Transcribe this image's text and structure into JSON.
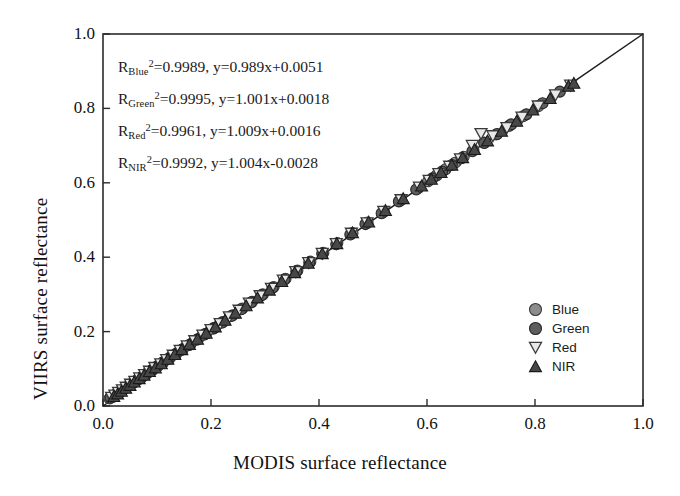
{
  "chart_data": {
    "type": "scatter",
    "title": "",
    "xlabel": "MODIS surface reflectance",
    "ylabel": "VIIRS surface reflectance",
    "xlim": [
      0.0,
      1.0
    ],
    "ylim": [
      0.0,
      1.0
    ],
    "xticks": [
      "0.0",
      "0.2",
      "0.4",
      "0.6",
      "0.8",
      "1.0"
    ],
    "yticks": [
      "0.0",
      "0.2",
      "0.4",
      "0.6",
      "0.8",
      "1.0"
    ],
    "xtick_values": [
      0.0,
      0.2,
      0.4,
      0.6,
      0.8,
      1.0
    ],
    "ytick_values": [
      0.0,
      0.2,
      0.4,
      0.6,
      0.8,
      1.0
    ],
    "grid": false,
    "legend_position": "lower-right",
    "reference_line": {
      "name": "one-to-one-line",
      "from": [
        0.0,
        0.0
      ],
      "to": [
        1.0,
        1.0
      ],
      "color": "#1a1a1a"
    },
    "annotations": [
      {
        "band": "Blue",
        "r2": "0.9989",
        "equation": "y=0.989x+0.0051",
        "text": "R_Blue^2 =0.9989, y=0.989x+0.0051"
      },
      {
        "band": "Green",
        "r2": "0.9995",
        "equation": "y=1.001x+0.0018",
        "text": "R_Green^2 =0.9995, y=1.001x+0.0018"
      },
      {
        "band": "Red",
        "r2": "0.9961",
        "equation": "y=1.009x+0.0016",
        "text": "R_Red^2 =0.9961, y=1.009x+0.0016"
      },
      {
        "band": "NIR",
        "r2": "0.9992",
        "equation": "y=1.004x-0.0028",
        "text": "R_NIR^2 =0.9992, y=1.004x-0.0028"
      }
    ],
    "series": [
      {
        "name": "Blue",
        "label": "Blue",
        "marker": "circle",
        "fill": "#8c8c8c",
        "stroke": "#3a3a3a",
        "marker_size": 11,
        "points": [
          [
            0.012,
            0.02
          ],
          [
            0.018,
            0.024
          ],
          [
            0.024,
            0.031
          ],
          [
            0.03,
            0.036
          ],
          [
            0.036,
            0.042
          ],
          [
            0.042,
            0.049
          ],
          [
            0.05,
            0.057
          ],
          [
            0.058,
            0.064
          ],
          [
            0.066,
            0.072
          ],
          [
            0.074,
            0.08
          ],
          [
            0.082,
            0.088
          ],
          [
            0.092,
            0.097
          ],
          [
            0.102,
            0.108
          ],
          [
            0.112,
            0.118
          ],
          [
            0.124,
            0.13
          ],
          [
            0.136,
            0.141
          ],
          [
            0.148,
            0.153
          ],
          [
            0.162,
            0.166
          ],
          [
            0.176,
            0.18
          ],
          [
            0.19,
            0.194
          ],
          [
            0.206,
            0.21
          ],
          [
            0.222,
            0.226
          ],
          [
            0.24,
            0.244
          ],
          [
            0.258,
            0.262
          ],
          [
            0.276,
            0.28
          ],
          [
            0.296,
            0.3
          ],
          [
            0.316,
            0.32
          ],
          [
            0.338,
            0.342
          ],
          [
            0.36,
            0.364
          ],
          [
            0.384,
            0.388
          ],
          [
            0.408,
            0.412
          ],
          [
            0.434,
            0.438
          ],
          [
            0.462,
            0.465
          ],
          [
            0.49,
            0.493
          ],
          [
            0.52,
            0.522
          ],
          [
            0.552,
            0.554
          ],
          [
            0.584,
            0.586
          ],
          [
            0.602,
            0.604
          ],
          [
            0.618,
            0.62
          ],
          [
            0.634,
            0.636
          ],
          [
            0.652,
            0.654
          ],
          [
            0.668,
            0.67
          ],
          [
            0.686,
            0.688
          ],
          [
            0.706,
            0.708
          ],
          [
            0.728,
            0.73
          ],
          [
            0.752,
            0.753
          ],
          [
            0.778,
            0.779
          ],
          [
            0.806,
            0.806
          ]
        ]
      },
      {
        "name": "Green",
        "label": "Green",
        "marker": "circle",
        "fill": "#5e5e5e",
        "stroke": "#262626",
        "marker_size": 11,
        "points": [
          [
            0.014,
            0.022
          ],
          [
            0.02,
            0.028
          ],
          [
            0.026,
            0.034
          ],
          [
            0.033,
            0.04
          ],
          [
            0.04,
            0.047
          ],
          [
            0.047,
            0.054
          ],
          [
            0.055,
            0.062
          ],
          [
            0.063,
            0.07
          ],
          [
            0.072,
            0.078
          ],
          [
            0.08,
            0.086
          ],
          [
            0.09,
            0.096
          ],
          [
            0.1,
            0.106
          ],
          [
            0.11,
            0.116
          ],
          [
            0.122,
            0.127
          ],
          [
            0.134,
            0.139
          ],
          [
            0.146,
            0.151
          ],
          [
            0.16,
            0.164
          ],
          [
            0.174,
            0.178
          ],
          [
            0.188,
            0.192
          ],
          [
            0.204,
            0.208
          ],
          [
            0.22,
            0.224
          ],
          [
            0.238,
            0.242
          ],
          [
            0.256,
            0.26
          ],
          [
            0.274,
            0.278
          ],
          [
            0.294,
            0.298
          ],
          [
            0.314,
            0.318
          ],
          [
            0.336,
            0.34
          ],
          [
            0.358,
            0.362
          ],
          [
            0.382,
            0.386
          ],
          [
            0.406,
            0.41
          ],
          [
            0.432,
            0.435
          ],
          [
            0.458,
            0.461
          ],
          [
            0.486,
            0.489
          ],
          [
            0.516,
            0.518
          ],
          [
            0.548,
            0.55
          ],
          [
            0.58,
            0.582
          ],
          [
            0.61,
            0.612
          ],
          [
            0.628,
            0.63
          ],
          [
            0.646,
            0.648
          ],
          [
            0.664,
            0.666
          ],
          [
            0.684,
            0.685
          ],
          [
            0.706,
            0.707
          ],
          [
            0.73,
            0.731
          ],
          [
            0.756,
            0.757
          ],
          [
            0.784,
            0.784
          ],
          [
            0.814,
            0.814
          ],
          [
            0.846,
            0.845
          ]
        ]
      },
      {
        "name": "Red",
        "label": "Red",
        "marker": "triangle-down-open",
        "fill": "#e8e8e8",
        "stroke": "#3a3a3a",
        "marker_size": 12,
        "points": [
          [
            0.016,
            0.023
          ],
          [
            0.022,
            0.029
          ],
          [
            0.029,
            0.036
          ],
          [
            0.036,
            0.043
          ],
          [
            0.043,
            0.05
          ],
          [
            0.051,
            0.058
          ],
          [
            0.059,
            0.066
          ],
          [
            0.068,
            0.075
          ],
          [
            0.077,
            0.084
          ],
          [
            0.086,
            0.093
          ],
          [
            0.096,
            0.103
          ],
          [
            0.107,
            0.113
          ],
          [
            0.118,
            0.124
          ],
          [
            0.13,
            0.136
          ],
          [
            0.143,
            0.149
          ],
          [
            0.156,
            0.161
          ],
          [
            0.17,
            0.175
          ],
          [
            0.185,
            0.19
          ],
          [
            0.2,
            0.205
          ],
          [
            0.217,
            0.221
          ],
          [
            0.234,
            0.239
          ],
          [
            0.252,
            0.257
          ],
          [
            0.271,
            0.276
          ],
          [
            0.291,
            0.296
          ],
          [
            0.312,
            0.316
          ],
          [
            0.334,
            0.338
          ],
          [
            0.357,
            0.361
          ],
          [
            0.381,
            0.385
          ],
          [
            0.406,
            0.41
          ],
          [
            0.432,
            0.436
          ],
          [
            0.46,
            0.464
          ],
          [
            0.489,
            0.492
          ],
          [
            0.52,
            0.523
          ],
          [
            0.552,
            0.554
          ],
          [
            0.586,
            0.588
          ],
          [
            0.604,
            0.606
          ],
          [
            0.622,
            0.624
          ],
          [
            0.642,
            0.644
          ],
          [
            0.662,
            0.664
          ],
          [
            0.684,
            0.7
          ],
          [
            0.7,
            0.732
          ],
          [
            0.722,
            0.726
          ],
          [
            0.748,
            0.748
          ],
          [
            0.776,
            0.776
          ],
          [
            0.806,
            0.806
          ],
          [
            0.838,
            0.836
          ],
          [
            0.866,
            0.862
          ]
        ]
      },
      {
        "name": "NIR",
        "label": "NIR",
        "marker": "triangle-up-filled",
        "fill": "#474747",
        "stroke": "#1a1a1a",
        "marker_size": 12,
        "points": [
          [
            0.02,
            0.026
          ],
          [
            0.027,
            0.033
          ],
          [
            0.034,
            0.04
          ],
          [
            0.042,
            0.048
          ],
          [
            0.05,
            0.056
          ],
          [
            0.058,
            0.065
          ],
          [
            0.067,
            0.074
          ],
          [
            0.076,
            0.083
          ],
          [
            0.086,
            0.093
          ],
          [
            0.097,
            0.103
          ],
          [
            0.108,
            0.114
          ],
          [
            0.12,
            0.126
          ],
          [
            0.133,
            0.139
          ],
          [
            0.146,
            0.152
          ],
          [
            0.16,
            0.166
          ],
          [
            0.175,
            0.18
          ],
          [
            0.191,
            0.196
          ],
          [
            0.208,
            0.213
          ],
          [
            0.226,
            0.231
          ],
          [
            0.245,
            0.25
          ],
          [
            0.265,
            0.27
          ],
          [
            0.286,
            0.291
          ],
          [
            0.308,
            0.312
          ],
          [
            0.331,
            0.335
          ],
          [
            0.355,
            0.359
          ],
          [
            0.38,
            0.384
          ],
          [
            0.406,
            0.41
          ],
          [
            0.433,
            0.437
          ],
          [
            0.462,
            0.466
          ],
          [
            0.492,
            0.495
          ],
          [
            0.523,
            0.526
          ],
          [
            0.556,
            0.558
          ],
          [
            0.59,
            0.592
          ],
          [
            0.608,
            0.61
          ],
          [
            0.626,
            0.628
          ],
          [
            0.646,
            0.648
          ],
          [
            0.666,
            0.668
          ],
          [
            0.688,
            0.69
          ],
          [
            0.712,
            0.713
          ],
          [
            0.738,
            0.739
          ],
          [
            0.766,
            0.766
          ],
          [
            0.796,
            0.796
          ],
          [
            0.828,
            0.827
          ],
          [
            0.862,
            0.86
          ],
          [
            0.872,
            0.868
          ]
        ]
      }
    ]
  }
}
